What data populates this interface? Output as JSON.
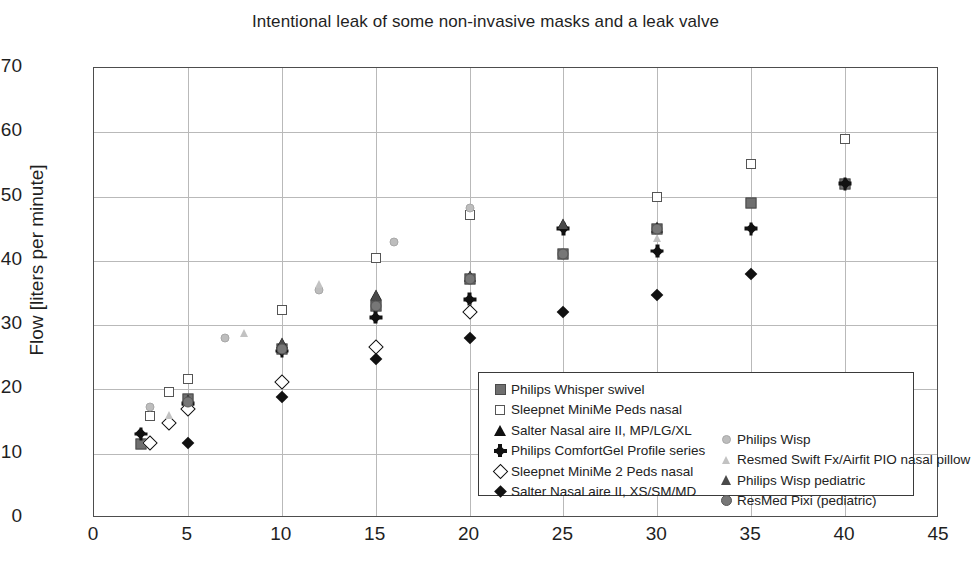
{
  "chart_data": {
    "type": "scatter",
    "title": "Intentional leak of some non-invasive masks and a leak valve",
    "xlabel": "",
    "ylabel": "Flow [liters per minute]",
    "xlim": [
      0,
      45
    ],
    "ylim": [
      0,
      70
    ],
    "xticks": [
      "0",
      "5",
      "10",
      "15",
      "20",
      "25",
      "30",
      "35",
      "40",
      "45"
    ],
    "yticks": [
      "0",
      "10",
      "20",
      "30",
      "40",
      "50",
      "60",
      "70"
    ],
    "grid": true,
    "legend_position": "inside-lower-right",
    "series": [
      {
        "name": "Philips Whisper swivel",
        "marker": "square-filled",
        "color": "#6f6f6f",
        "points": [
          [
            2.5,
            11.5
          ],
          [
            5,
            18.5
          ],
          [
            10,
            26.3
          ],
          [
            15,
            33.0
          ],
          [
            20,
            37.2
          ],
          [
            25,
            41.0
          ],
          [
            30,
            45.0
          ],
          [
            35,
            49.0
          ],
          [
            40,
            52.0
          ]
        ]
      },
      {
        "name": "Sleepnet MiniMe Peds nasal",
        "marker": "square-open",
        "color": "#555555",
        "points": [
          [
            3,
            15.8
          ],
          [
            4,
            19.6
          ],
          [
            5,
            21.6
          ],
          [
            10,
            32.4
          ],
          [
            15,
            40.5
          ],
          [
            20,
            47.2
          ],
          [
            30,
            50.0
          ],
          [
            35,
            55.0
          ],
          [
            40,
            59.0
          ]
        ]
      },
      {
        "name": "Salter Nasal aire II, MP/LG/XL",
        "marker": "triangle-filled",
        "color": "#111111",
        "points": [
          [
            5,
            18.3
          ],
          [
            10,
            27.2
          ],
          [
            15,
            34.7
          ],
          [
            20,
            37.6
          ],
          [
            25,
            45.8
          ],
          [
            30,
            45.2
          ]
        ]
      },
      {
        "name": "Philips ComfortGel Profile series",
        "marker": "plus-diamond",
        "color": "#111111",
        "points": [
          [
            2.5,
            13.1
          ],
          [
            5,
            17.8
          ],
          [
            10,
            26.0
          ],
          [
            15,
            31.2
          ],
          [
            20,
            34.0
          ],
          [
            25,
            45.0
          ],
          [
            30,
            41.5
          ],
          [
            35,
            45.0
          ],
          [
            40,
            52.0
          ]
        ]
      },
      {
        "name": "Sleepnet MiniMe 2 Peds nasal",
        "marker": "diamond-open",
        "color": "#111111",
        "points": [
          [
            3,
            11.6
          ],
          [
            4,
            14.8
          ],
          [
            5,
            17.0
          ],
          [
            10,
            21.2
          ],
          [
            15,
            26.6
          ],
          [
            20,
            32.0
          ]
        ]
      },
      {
        "name": "Salter Nasal aire II, XS/SM/MD",
        "marker": "diamond-filled",
        "color": "#111111",
        "points": [
          [
            5,
            11.7
          ],
          [
            10,
            18.8
          ],
          [
            15,
            24.8
          ],
          [
            20,
            28.0
          ],
          [
            25,
            32.0
          ],
          [
            30,
            34.7
          ],
          [
            35,
            38.0
          ]
        ]
      },
      {
        "name": "Philips Wisp",
        "marker": "circle-gray",
        "color": "#bdbdbd",
        "points": [
          [
            3,
            17.3
          ],
          [
            7,
            28.0
          ],
          [
            12,
            35.5
          ],
          [
            16,
            43.0
          ],
          [
            20,
            48.2
          ]
        ]
      },
      {
        "name": "Resmed Swift Fx/Airfit PIO nasal pillow",
        "marker": "triangle-gray",
        "color": "#c2c2c2",
        "points": [
          [
            4,
            16.1
          ],
          [
            8,
            28.8
          ],
          [
            12,
            36.4
          ],
          [
            30,
            43.5
          ]
        ]
      },
      {
        "name": "Philips Wisp pediatric",
        "marker": "triangle-dark",
        "color": "#4a4a4a",
        "points": [
          [
            5,
            18.3
          ],
          [
            10,
            27.2
          ],
          [
            15,
            34.7
          ],
          [
            20,
            37.6
          ],
          [
            25,
            45.8
          ]
        ]
      },
      {
        "name": "ResMed Pixi (pediatric)",
        "marker": "circle-dark",
        "color": "#777777",
        "points": [
          [
            5,
            18.0
          ],
          [
            10,
            26.3
          ],
          [
            15,
            33.0
          ],
          [
            20,
            37.2
          ],
          [
            25,
            41.0
          ],
          [
            30,
            45.0
          ]
        ]
      }
    ]
  },
  "legend": {
    "left_column": [
      {
        "label": "Philips Whisper swivel",
        "marker": "square-filled"
      },
      {
        "label": "Sleepnet MiniMe Peds nasal",
        "marker": "square-open"
      },
      {
        "label": "Salter Nasal aire II, MP/LG/XL",
        "marker": "triangle-filled"
      },
      {
        "label": "Philips ComfortGel Profile series",
        "marker": "plus-diamond"
      },
      {
        "label": "Sleepnet MiniMe 2 Peds nasal",
        "marker": "diamond-open"
      },
      {
        "label": "Salter Nasal aire II, XS/SM/MD",
        "marker": "diamond-filled"
      }
    ],
    "right_column": [
      {
        "label": "Philips Wisp",
        "marker": "circle-gray"
      },
      {
        "label": "Resmed Swift Fx/Airfit PIO nasal pillow",
        "marker": "triangle-gray"
      },
      {
        "label": "Philips Wisp pediatric",
        "marker": "triangle-dark"
      },
      {
        "label": "ResMed Pixi (pediatric)",
        "marker": "circle-dark"
      }
    ]
  }
}
